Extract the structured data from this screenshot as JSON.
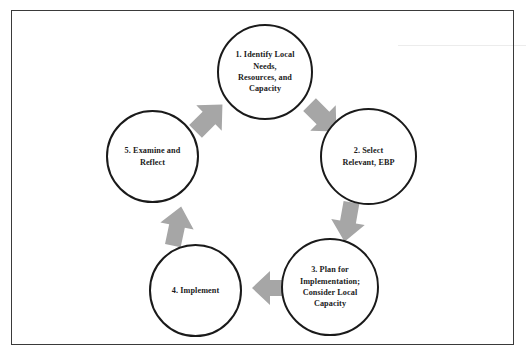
{
  "document": {
    "type": "cyclical-process-diagram",
    "title": "",
    "frame_border_color": "#3a3a3a",
    "background_color": "#ffffff"
  },
  "diagram": {
    "circle_stroke_color": "#1a1a1a",
    "circle_fill_color": "#ffffff",
    "arrow_color": "#a6a6a6",
    "text_color": "#1b1b1b",
    "flow_direction": "clockwise",
    "nodes": [
      {
        "id": "node-1",
        "number": "1",
        "label": "1. Identify Local\nNeeds,\nResources, and\nCapacity",
        "position": "top"
      },
      {
        "id": "node-2",
        "number": "2",
        "label": "2. Select\nRelevant, EBP",
        "position": "right"
      },
      {
        "id": "node-3",
        "number": "3",
        "label": "3. Plan for\nImplementation;\nConsider Local\nCapacity",
        "position": "bottom-right"
      },
      {
        "id": "node-4",
        "number": "4",
        "label": "4. Implement",
        "position": "bottom-left"
      },
      {
        "id": "node-5",
        "number": "5",
        "label": "5. Examine and\nReflect",
        "position": "left"
      }
    ],
    "arrows": [
      {
        "id": "arrow-5-1",
        "from": "node-5",
        "to": "node-1",
        "direction": "up-right"
      },
      {
        "id": "arrow-1-2",
        "from": "node-1",
        "to": "node-2",
        "direction": "down-right"
      },
      {
        "id": "arrow-2-3",
        "from": "node-2",
        "to": "node-3",
        "direction": "down"
      },
      {
        "id": "arrow-3-4",
        "from": "node-3",
        "to": "node-4",
        "direction": "left"
      },
      {
        "id": "arrow-4-5",
        "from": "node-4",
        "to": "node-5",
        "direction": "up"
      }
    ]
  }
}
